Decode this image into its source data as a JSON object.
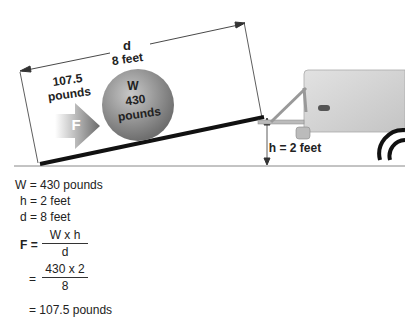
{
  "diagram": {
    "distance_label": "d",
    "distance_value": "8 feet",
    "force_value": "107.5",
    "force_unit": "pounds",
    "force_symbol": "F",
    "weight_symbol": "W",
    "weight_value": "430",
    "weight_unit": "pounds",
    "height_label": "h = 2 feet"
  },
  "equations": {
    "given": [
      "W = 430 pounds",
      "h = 2 feet",
      "d = 8 feet"
    ],
    "formula_lhs": "F =",
    "formula_num": "W x  h",
    "formula_den": "d",
    "subst_eq": "=",
    "subst_num": "430 x  2",
    "subst_den": "8",
    "result": "=  107.5 pounds"
  },
  "colors": {
    "ramp": "#111111",
    "ball": "#8a8a8a",
    "vehicle": "#d4d4d4",
    "arrow": "#7a7a7a"
  }
}
